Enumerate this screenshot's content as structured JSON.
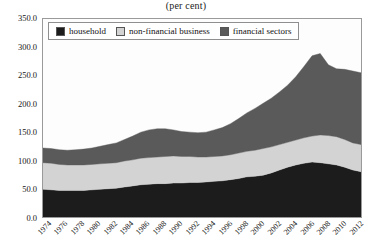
{
  "title": "(per cent)",
  "legend": {
    "items": [
      {
        "label": "household",
        "color": "#1c1c1c"
      },
      {
        "label": "non-financial business",
        "color": "#d3d3d3"
      },
      {
        "label": "financial sectors",
        "color": "#5a5a5a"
      }
    ]
  },
  "chart_data": {
    "type": "area",
    "stacked": true,
    "title": "(per cent)",
    "xlabel": "",
    "ylabel": "",
    "ylim": [
      0.0,
      350.0
    ],
    "yticks": [
      "0.0",
      "50.0",
      "100.0",
      "150.0",
      "200.0",
      "250.0",
      "300.0",
      "350.0"
    ],
    "ytick_values": [
      0,
      50,
      100,
      150,
      200,
      250,
      300,
      350
    ],
    "grid": false,
    "legend_position": "top-left",
    "x": [
      1974,
      1975,
      1976,
      1977,
      1978,
      1979,
      1980,
      1981,
      1982,
      1983,
      1984,
      1985,
      1986,
      1987,
      1988,
      1989,
      1990,
      1991,
      1992,
      1993,
      1994,
      1995,
      1996,
      1997,
      1998,
      1999,
      2000,
      2001,
      2002,
      2003,
      2004,
      2005,
      2006,
      2007,
      2008,
      2009,
      2010,
      2011,
      2012,
      2013
    ],
    "xticks": [
      "1974",
      "1976",
      "1978",
      "1980",
      "1982",
      "1984",
      "1986",
      "1988",
      "1990",
      "1992",
      "1994",
      "1996",
      "1998",
      "2000",
      "2002",
      "2004",
      "2006",
      "2008",
      "2010",
      "2012"
    ],
    "series": [
      {
        "name": "household",
        "color": "#1c1c1c",
        "values": [
          49,
          48,
          47,
          47,
          47,
          47,
          48,
          49,
          50,
          51,
          53,
          55,
          57,
          58,
          59,
          59,
          60,
          60,
          61,
          61,
          62,
          63,
          64,
          66,
          68,
          71,
          72,
          74,
          78,
          83,
          88,
          92,
          95,
          97,
          96,
          94,
          92,
          88,
          83,
          80
        ]
      },
      {
        "name": "non-financial business",
        "color": "#d3d3d3",
        "values": [
          47,
          47,
          46,
          45,
          45,
          45,
          45,
          45,
          45,
          45,
          46,
          46,
          47,
          47,
          47,
          48,
          48,
          47,
          46,
          45,
          44,
          44,
          44,
          44,
          45,
          45,
          46,
          47,
          46,
          45,
          44,
          44,
          45,
          46,
          49,
          50,
          50,
          49,
          48,
          48
        ]
      },
      {
        "name": "financial sectors",
        "color": "#5a5a5a",
        "values": [
          26,
          26,
          26,
          26,
          27,
          28,
          29,
          31,
          33,
          35,
          38,
          42,
          46,
          49,
          50,
          49,
          46,
          44,
          43,
          43,
          44,
          47,
          50,
          55,
          61,
          68,
          74,
          80,
          86,
          93,
          101,
          112,
          126,
          142,
          144,
          125,
          120,
          124,
          127,
          127
        ]
      }
    ]
  }
}
